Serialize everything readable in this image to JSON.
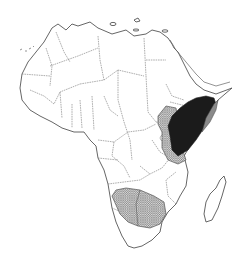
{
  "map": {
    "subject": "Africa",
    "style": "black-and-white outline map with country borders",
    "colors": {
      "background": "#ffffff",
      "outline": "#555555",
      "range_dark": "#1b1b1b",
      "range_grey": "#8a8a8a",
      "range_hatched": "#b8b8b8"
    },
    "shaded_regions": [
      {
        "id": "horn-of-africa-dark",
        "pattern": "solid-black",
        "area": "Ethiopia / southern Somalia / northern Kenya"
      },
      {
        "id": "somalia-grey-wedge",
        "pattern": "solid-grey",
        "area": "eastern Somalia coast"
      },
      {
        "id": "east-africa-hatched",
        "pattern": "crosshatch",
        "area": "Uganda / western Kenya / northern Tanzania"
      },
      {
        "id": "southern-africa-hatched",
        "pattern": "crosshatch",
        "area": "Namibia / Botswana"
      }
    ],
    "islands": [
      "Madagascar",
      "Canary Islands",
      "Mediterranean islands"
    ]
  }
}
